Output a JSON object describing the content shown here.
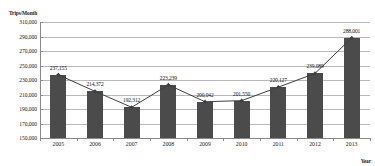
{
  "chart_data": {
    "type": "bar",
    "title": "",
    "subtitle": "",
    "xlabel": "Year",
    "ylabel": "Trips/Month",
    "categories": [
      "2005",
      "2006",
      "2007",
      "2008",
      "2009",
      "2010",
      "2011",
      "2012",
      "2013"
    ],
    "values": [
      237155,
      214372,
      192312,
      223239,
      200042,
      201550,
      220127,
      239089,
      288001
    ],
    "data_labels": [
      "237,155",
      "214,372",
      "192,312",
      "223,239",
      "200,042",
      "201,550",
      "220,127",
      "239,089",
      "288,001"
    ],
    "ylim": [
      150000,
      310000
    ],
    "ytick_step": 20000,
    "ytick_labels": [
      "310,000",
      "290,000",
      "270,000",
      "250,000",
      "230,000",
      "210,000",
      "190,000",
      "170,000",
      "150,000"
    ],
    "ytick_values": [
      310000,
      290000,
      270000,
      250000,
      230000,
      210000,
      190000,
      170000,
      150000
    ],
    "grid": true,
    "grid_axis": "y",
    "legend": false,
    "legend_position": "none",
    "series": [
      {
        "name": "Trips/Month",
        "kind": "bar",
        "color": "#4b4b4b",
        "values": [
          237155,
          214372,
          192312,
          223239,
          200042,
          201550,
          220127,
          239089,
          288001
        ]
      },
      {
        "name": "Trend",
        "kind": "line",
        "color": "#3f3f3f",
        "marker": "diamond",
        "values": [
          237155,
          214372,
          192312,
          223239,
          200042,
          201550,
          220127,
          239089,
          288001
        ]
      }
    ],
    "annotations": []
  },
  "colors": {
    "bar_fill": "#4b4b4b",
    "line": "#3f3f3f",
    "grid": "#b9b9b9",
    "axis": "#8a8a8a",
    "text": "#1a1a1a",
    "background": "#ffffff"
  }
}
